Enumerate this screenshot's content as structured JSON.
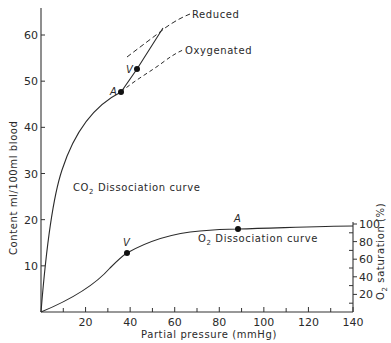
{
  "chart_data": {
    "type": "line",
    "title": "",
    "xlabel": "Partial pressure (mmHg)",
    "ylabel": "Content ml/100ml blood",
    "ylabel_right": "O2 saturation (%)",
    "xlim": [
      0,
      140
    ],
    "ylim": [
      0,
      65
    ],
    "ylim_right": [
      0,
      100
    ],
    "grid": false,
    "x_ticks": [
      20,
      40,
      60,
      80,
      100,
      120,
      140
    ],
    "x_minor_ticks": [
      10,
      30,
      50,
      70,
      90,
      110,
      130
    ],
    "y_ticks": [
      10,
      20,
      30,
      40,
      50,
      60
    ],
    "y_right_ticks": [
      20,
      40,
      60,
      80,
      100
    ],
    "series": [
      {
        "name": "CO2 Dissociation curve",
        "x": [
          0,
          2,
          5,
          10,
          15,
          20,
          25,
          30,
          35,
          37,
          40
        ],
        "y": [
          0,
          12,
          22,
          31,
          36.5,
          40.5,
          43.5,
          45.5,
          47.3,
          47.8,
          49
        ]
      },
      {
        "name": "O2 Dissociation curve",
        "x": [
          0,
          10,
          20,
          30,
          40,
          50,
          60,
          70,
          80,
          90,
          100,
          120,
          140
        ],
        "y": [
          0,
          2.5,
          5.5,
          9,
          12.3,
          15,
          16.5,
          17.3,
          17.8,
          18.2,
          18.4,
          18.6,
          18.7
        ]
      },
      {
        "name": "Reduced",
        "style": "dashed",
        "x": [
          39,
          48,
          57,
          67
        ],
        "y": [
          55,
          58.5,
          61.5,
          64.5
        ]
      },
      {
        "name": "Oxygenated",
        "style": "dashed",
        "x": [
          37,
          45,
          54,
          63
        ],
        "y": [
          47.8,
          51,
          54.5,
          57.5
        ]
      },
      {
        "name": "Physiological CO2 line",
        "style": "solid",
        "x": [
          37,
          43,
          55
        ],
        "y": [
          47.8,
          52.5,
          61.5
        ]
      }
    ],
    "annotations": [
      {
        "label": "A",
        "curve": "CO2",
        "x": 36,
        "y": 47.8
      },
      {
        "label": "V",
        "curve": "CO2",
        "x": 43,
        "y": 52.5
      },
      {
        "label": "V",
        "curve": "O2",
        "x": 39,
        "y": 12.3
      },
      {
        "label": "A",
        "curve": "O2",
        "x": 89,
        "y": 18.2
      }
    ],
    "legend": [
      "Reduced",
      "Oxygenated"
    ],
    "text_labels": {
      "co2_curve": "CO2 Dissociation curve",
      "o2_curve": "O2 Dissociation curve",
      "reduced": "Reduced",
      "oxygenated": "Oxygenated"
    }
  },
  "axis": {
    "x_label": "Partial pressure (mmHg)",
    "y_label": "Content ml/100ml blood",
    "y_right_label_main": "O",
    "y_right_label_sub": "2",
    "y_right_label_rest": " saturation (%)",
    "x_ticks": [
      "20",
      "40",
      "60",
      "80",
      "100",
      "120",
      "140"
    ],
    "y_ticks": [
      "10",
      "20",
      "30",
      "40",
      "50",
      "60"
    ],
    "y_right_ticks": [
      "20",
      "40",
      "60",
      "80",
      "100"
    ]
  },
  "labels": {
    "reduced": "Reduced",
    "oxygenated": "Oxygenated",
    "co2_prefix": "CO",
    "co2_sub": "2",
    "co2_suffix": " Dissociation curve",
    "o2_prefix": "O",
    "o2_sub": "2",
    "o2_suffix": " Dissociation curve",
    "point_a": "A",
    "point_v": "V"
  }
}
